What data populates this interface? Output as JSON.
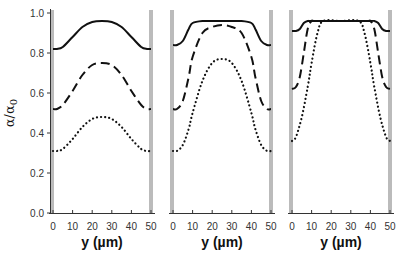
{
  "chart_data": [
    {
      "type": "line",
      "panel": "left",
      "xlabel": "y (µm)",
      "ylabel": "α/α0",
      "xlim": [
        0,
        50
      ],
      "ylim": [
        0,
        1.0
      ],
      "x_ticks": [
        "0",
        "10",
        "20",
        "30",
        "40",
        "50"
      ],
      "y_ticks": [
        "0.0",
        "0.2",
        "0.4",
        "0.6",
        "0.8",
        "1.0"
      ],
      "grid": false,
      "legend": "none",
      "series": [
        {
          "name": "solid",
          "style": "solid",
          "x": [
            0,
            2,
            5,
            10,
            15,
            20,
            25,
            30,
            35,
            40,
            45,
            48,
            50
          ],
          "values": [
            0.82,
            0.82,
            0.83,
            0.88,
            0.93,
            0.955,
            0.96,
            0.955,
            0.93,
            0.88,
            0.83,
            0.82,
            0.82
          ]
        },
        {
          "name": "dashed",
          "style": "dashed",
          "x": [
            0,
            2,
            5,
            10,
            15,
            20,
            25,
            30,
            35,
            40,
            45,
            48,
            50
          ],
          "values": [
            0.52,
            0.52,
            0.54,
            0.61,
            0.69,
            0.74,
            0.75,
            0.74,
            0.69,
            0.61,
            0.54,
            0.52,
            0.52
          ]
        },
        {
          "name": "dotted",
          "style": "dotted",
          "x": [
            0,
            2,
            5,
            10,
            15,
            20,
            25,
            30,
            35,
            40,
            45,
            48,
            50
          ],
          "values": [
            0.31,
            0.31,
            0.32,
            0.37,
            0.43,
            0.47,
            0.48,
            0.47,
            0.43,
            0.37,
            0.32,
            0.31,
            0.31
          ]
        }
      ]
    },
    {
      "type": "line",
      "panel": "middle",
      "xlabel": "y (µm)",
      "xlim": [
        0,
        50
      ],
      "ylim": [
        0,
        1.0
      ],
      "x_ticks": [
        "0",
        "10",
        "20",
        "30",
        "40",
        "50"
      ],
      "grid": false,
      "legend": "none",
      "series": [
        {
          "name": "solid",
          "style": "solid",
          "x": [
            0,
            2,
            5,
            8,
            10,
            15,
            20,
            25,
            30,
            35,
            40,
            42,
            45,
            48,
            50
          ],
          "values": [
            0.84,
            0.84,
            0.86,
            0.92,
            0.95,
            0.96,
            0.96,
            0.96,
            0.96,
            0.96,
            0.95,
            0.92,
            0.86,
            0.84,
            0.84
          ]
        },
        {
          "name": "dashed",
          "style": "dashed",
          "x": [
            0,
            2,
            5,
            8,
            10,
            15,
            20,
            25,
            30,
            35,
            40,
            42,
            45,
            48,
            50
          ],
          "values": [
            0.52,
            0.52,
            0.56,
            0.68,
            0.78,
            0.9,
            0.93,
            0.94,
            0.93,
            0.9,
            0.78,
            0.68,
            0.56,
            0.52,
            0.52
          ]
        },
        {
          "name": "dotted",
          "style": "dotted",
          "x": [
            0,
            2,
            5,
            8,
            10,
            15,
            20,
            25,
            30,
            35,
            40,
            42,
            45,
            48,
            50
          ],
          "values": [
            0.31,
            0.31,
            0.34,
            0.42,
            0.5,
            0.66,
            0.75,
            0.77,
            0.75,
            0.66,
            0.5,
            0.42,
            0.34,
            0.31,
            0.31
          ]
        }
      ]
    },
    {
      "type": "line",
      "panel": "right",
      "xlabel": "y (µm)",
      "xlim": [
        0,
        50
      ],
      "ylim": [
        0,
        1.0
      ],
      "x_ticks": [
        "0",
        "10",
        "20",
        "30",
        "40",
        "50"
      ],
      "grid": false,
      "legend": "none",
      "series": [
        {
          "name": "solid",
          "style": "solid",
          "x": [
            0,
            2,
            4,
            6,
            8,
            10,
            25,
            40,
            42,
            44,
            46,
            48,
            50
          ],
          "values": [
            0.91,
            0.91,
            0.92,
            0.95,
            0.96,
            0.96,
            0.96,
            0.96,
            0.96,
            0.95,
            0.92,
            0.91,
            0.91
          ]
        },
        {
          "name": "dashed",
          "style": "dashed",
          "x": [
            0,
            2,
            4,
            6,
            8,
            10,
            12,
            25,
            38,
            40,
            42,
            44,
            46,
            48,
            50
          ],
          "values": [
            0.62,
            0.63,
            0.68,
            0.8,
            0.92,
            0.96,
            0.96,
            0.96,
            0.96,
            0.96,
            0.92,
            0.8,
            0.68,
            0.63,
            0.62
          ]
        },
        {
          "name": "dotted",
          "style": "dotted",
          "x": [
            0,
            2,
            5,
            8,
            10,
            13,
            16,
            25,
            34,
            37,
            40,
            42,
            45,
            48,
            50
          ],
          "values": [
            0.36,
            0.38,
            0.48,
            0.63,
            0.75,
            0.9,
            0.96,
            0.96,
            0.96,
            0.9,
            0.75,
            0.63,
            0.48,
            0.38,
            0.36
          ]
        }
      ]
    }
  ],
  "labels": {
    "ylabel_alpha": "α/α",
    "ylabel_sub": "0",
    "xlabel": "y (µm)",
    "y_ticks": [
      "0.0",
      "0.2",
      "0.4",
      "0.6",
      "0.8",
      "1.0"
    ],
    "x_ticks": [
      "0",
      "10",
      "20",
      "30",
      "40",
      "50"
    ]
  },
  "colors": {
    "line": "#111111",
    "wall": "#bbbbbb",
    "axis": "#333333",
    "text": "#333333"
  }
}
